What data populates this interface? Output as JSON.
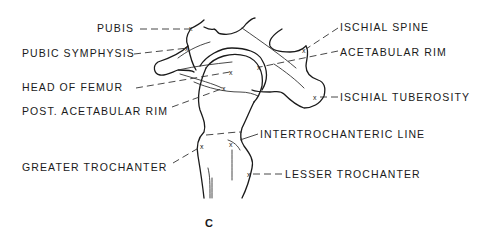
{
  "diagram": {
    "figure_label": "C",
    "labels": [
      {
        "id": "pubis",
        "text": "PUBIS",
        "side": "left"
      },
      {
        "id": "pubic_symphysis",
        "text": "PUBIC SYMPHYSIS",
        "side": "left"
      },
      {
        "id": "head_of_femur",
        "text": "HEAD OF FEMUR",
        "side": "left"
      },
      {
        "id": "post_acetabular_rim",
        "text": "POST. ACETABULAR RIM",
        "side": "left"
      },
      {
        "id": "greater_trochanter",
        "text": "GREATER TROCHANTER",
        "side": "left"
      },
      {
        "id": "ischial_spine",
        "text": "ISCHIAL SPINE",
        "side": "right"
      },
      {
        "id": "acetabular_rim",
        "text": "ACETABULAR RIM",
        "side": "right"
      },
      {
        "id": "ischial_tuberosity",
        "text": "ISCHIAL TUBEROSITY",
        "side": "right"
      },
      {
        "id": "intertrochanteric_line",
        "text": "INTERTROCHANTERIC LINE",
        "side": "right"
      },
      {
        "id": "lesser_trochanter",
        "text": "LESSER TROCHANTER",
        "side": "right"
      }
    ],
    "point_marker": "x",
    "colors": {
      "ink": "#1a1a1a",
      "background": "#ffffff"
    }
  }
}
